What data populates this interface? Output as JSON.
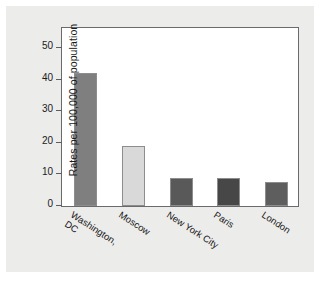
{
  "chart_data": {
    "type": "bar",
    "title": "",
    "subtitle": "",
    "xlabel": "",
    "ylabel": "Rates per 100,000 of population",
    "ylim": [
      0,
      57
    ],
    "yticks": [
      0,
      10,
      20,
      30,
      40,
      50
    ],
    "ytick_labels": [
      "0",
      "10",
      "20",
      "30",
      "40",
      "50"
    ],
    "grid": false,
    "legend": false,
    "legend_position": "none",
    "categories": [
      "Washington, DC",
      "Moscow",
      "New York City",
      "Paris",
      "London"
    ],
    "category_lines": [
      [
        "Washington,",
        "DC"
      ],
      [
        "Moscow"
      ],
      [
        "New York City"
      ],
      [
        "Paris"
      ],
      [
        "London"
      ]
    ],
    "values": [
      42,
      19,
      9,
      9,
      7.5
    ],
    "bar_colors": [
      "#7f7f7f",
      "#d9d9d9",
      "#595959",
      "#474747",
      "#5e5e5e"
    ],
    "bar_edge_color": "#8d8d8d",
    "plot_background": "#ffffff",
    "figure_background": "#ececeb",
    "axis_color": "#6a6a6a",
    "text_color": "#161616"
  }
}
